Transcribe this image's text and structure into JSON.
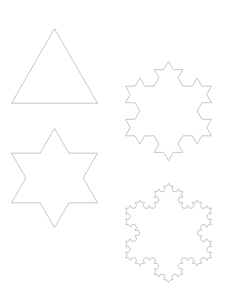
{
  "figure": {
    "width": 228,
    "height": 297,
    "background": "#ffffff",
    "stroke_color": "#b8b8b8",
    "stroke_width": 0.8
  },
  "flakes": [
    {
      "name": "koch-iteration-0",
      "iteration": 0,
      "cx": 54.5,
      "cy": 66,
      "side": 86
    },
    {
      "name": "koch-iteration-1",
      "iteration": 1,
      "cx": 54.5,
      "cy": 178,
      "side": 86
    },
    {
      "name": "koch-iteration-2",
      "iteration": 2,
      "cx": 168.5,
      "cy": 111,
      "side": 86
    },
    {
      "name": "koch-iteration-3",
      "iteration": 3,
      "cx": 168.5,
      "cy": 233,
      "side": 86
    }
  ]
}
